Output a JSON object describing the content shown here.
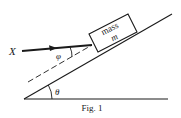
{
  "figure": {
    "caption": "Fig. 1",
    "block_label_line1": "mass",
    "block_label_line2": "m",
    "force_label": "X",
    "force_angle_label": "φ",
    "incline_angle_label": "θ",
    "colors": {
      "ink": "#1a1a1a",
      "background": "#ffffff"
    }
  }
}
